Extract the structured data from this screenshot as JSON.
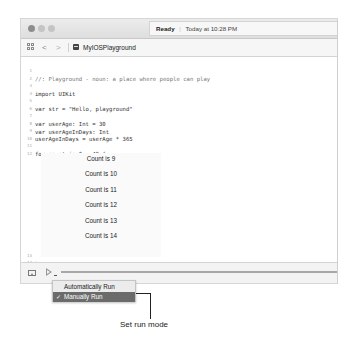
{
  "window": {
    "status": {
      "state": "Ready",
      "separator": "|",
      "timestamp": "Today at 10:28 PM"
    },
    "toolbar": {
      "back_glyph": "<",
      "forward_glyph": ">",
      "document_title": "MyIOSPlayground"
    },
    "editor": {
      "lines": [
        {
          "number": "1",
          "text": "//: Playground - noun: a place where people can play"
        },
        {
          "number": "2",
          "text": ""
        },
        {
          "number": "3",
          "text": "import UIKit"
        },
        {
          "number": "4",
          "text": ""
        },
        {
          "number": "5",
          "text": "var str = \"Hello, playground\""
        },
        {
          "number": "6",
          "text": ""
        },
        {
          "number": "7",
          "text": "var userAge: Int = 30"
        },
        {
          "number": "8",
          "text": "var userAgeInDays: Int"
        },
        {
          "number": "9",
          "text": "userAgeInDays = userAge * 365"
        },
        {
          "number": "10",
          "text": ""
        },
        {
          "number": "11",
          "text": "for count in 0...49 {"
        },
        {
          "number": "12",
          "text": "    print(\"Count is \\(count)\")"
        },
        {
          "number": "13",
          "text": "}"
        },
        {
          "number": "14",
          "text": ""
        }
      ],
      "output": [
        "Count is 9",
        "Count is 10",
        "Count is 11",
        "Count is 12",
        "Count is 13",
        "Count is 14"
      ]
    },
    "run_menu": {
      "items": [
        {
          "label": "Automatically Run",
          "checked": false
        },
        {
          "label": "Manually Run",
          "checked": true,
          "check_glyph": "✓"
        }
      ],
      "highlight_color": "#6b6b6b"
    }
  },
  "annotation": {
    "label": "Set run mode"
  }
}
